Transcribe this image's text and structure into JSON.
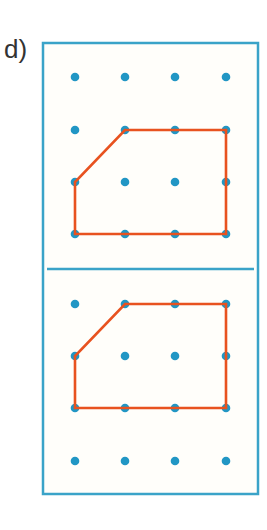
{
  "exercise": {
    "label": "d)"
  },
  "colors": {
    "frame": "#3aa3c8",
    "dot": "#2196c4",
    "shape": "#e8521f",
    "background": "#fffefa"
  },
  "geoboards": [
    {
      "name": "top-geoboard",
      "grid": "4x4",
      "shape_vertices": [
        [
          1,
          1
        ],
        [
          3,
          1
        ],
        [
          3,
          3
        ],
        [
          0,
          3
        ],
        [
          0,
          2
        ]
      ]
    },
    {
      "name": "bottom-geoboard",
      "grid": "4x4",
      "shape_vertices": [
        [
          1,
          0
        ],
        [
          3,
          0
        ],
        [
          3,
          2
        ],
        [
          0,
          2
        ],
        [
          0,
          1
        ]
      ]
    }
  ]
}
